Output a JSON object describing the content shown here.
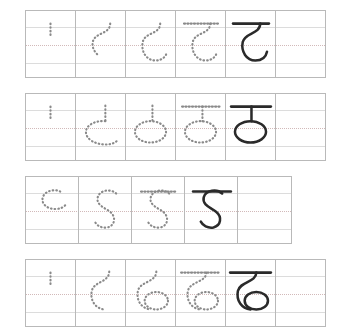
{
  "worksheet": {
    "title": "Devanagari letter tracing practice worksheet",
    "script": "Devanagari",
    "stroke_colors": {
      "solid": "#2a2a2a",
      "dotted": "#8a8a8a",
      "grid": "#b9b9b9",
      "guide_line": "#dcdcdc",
      "mid_guide_line": "#d2b9b9",
      "page_background": "#ffffff"
    },
    "rows": [
      {
        "id": "row-ta",
        "letter": "ट",
        "letter_name": "ta",
        "cell_count": 6,
        "steps": [
          {
            "index": 1,
            "label": "stroke-start-tick",
            "style": "dotted",
            "description": "short vertical tick"
          },
          {
            "index": 2,
            "label": "upper-curve",
            "style": "dotted",
            "description": "s-curve top of ta"
          },
          {
            "index": 3,
            "label": "full-hook",
            "style": "dotted",
            "description": "complete hook body"
          },
          {
            "index": 4,
            "label": "hook-with-headline",
            "style": "dotted",
            "description": "hook plus top headline"
          },
          {
            "index": 5,
            "label": "complete-letter",
            "style": "solid",
            "description": "finished letter ta"
          },
          {
            "index": 6,
            "label": "blank-practice",
            "style": "empty",
            "description": "empty practice cell"
          }
        ]
      },
      {
        "id": "row-tha",
        "letter": "ठ",
        "letter_name": "tha",
        "cell_count": 6,
        "steps": [
          {
            "index": 1,
            "label": "stroke-start-tick",
            "style": "dotted",
            "description": "short vertical tick"
          },
          {
            "index": 2,
            "label": "partial-oval",
            "style": "dotted",
            "description": "partial oval with stem"
          },
          {
            "index": 3,
            "label": "closed-oval",
            "style": "dotted",
            "description": "closed oval with stem"
          },
          {
            "index": 4,
            "label": "oval-with-headline",
            "style": "dotted",
            "description": "oval, stem and headline"
          },
          {
            "index": 5,
            "label": "complete-letter",
            "style": "solid",
            "description": "finished letter tha"
          },
          {
            "index": 6,
            "label": "blank-practice",
            "style": "empty",
            "description": "empty practice cell"
          }
        ]
      },
      {
        "id": "row-da",
        "letter": "ड",
        "letter_name": "da",
        "cell_count": 5,
        "steps": [
          {
            "index": 1,
            "label": "upper-hook",
            "style": "dotted",
            "description": "upper hook of da"
          },
          {
            "index": 2,
            "label": "full-body",
            "style": "dotted",
            "description": "full s-body of da"
          },
          {
            "index": 3,
            "label": "body-with-headline",
            "style": "dotted",
            "description": "body plus headline"
          },
          {
            "index": 4,
            "label": "complete-letter",
            "style": "solid",
            "description": "finished letter da"
          },
          {
            "index": 5,
            "label": "blank-practice",
            "style": "empty",
            "description": "empty practice cell"
          }
        ]
      },
      {
        "id": "row-dha",
        "letter": "ढ",
        "letter_name": "dha",
        "cell_count": 6,
        "steps": [
          {
            "index": 1,
            "label": "stroke-start-tick",
            "style": "dotted",
            "description": "short vertical tick"
          },
          {
            "index": 2,
            "label": "upper-hook",
            "style": "dotted",
            "description": "hook stroke"
          },
          {
            "index": 3,
            "label": "hook-with-loop",
            "style": "dotted",
            "description": "hook plus bottom loop"
          },
          {
            "index": 4,
            "label": "loop-with-headline",
            "style": "dotted",
            "description": "hook, loop and headline"
          },
          {
            "index": 5,
            "label": "complete-letter",
            "style": "solid",
            "description": "finished letter dha"
          },
          {
            "index": 6,
            "label": "blank-practice",
            "style": "empty",
            "description": "empty practice cell"
          }
        ]
      }
    ]
  }
}
